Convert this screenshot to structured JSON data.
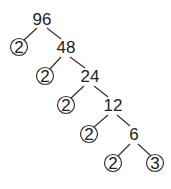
{
  "diagram": {
    "type": "factor-tree",
    "root": "96",
    "nodes": [
      {
        "id": "n96",
        "label": "96",
        "x": 42,
        "y": 19,
        "prime": false
      },
      {
        "id": "p1",
        "label": "2",
        "x": 19,
        "y": 47,
        "prime": true
      },
      {
        "id": "n48",
        "label": "48",
        "x": 66,
        "y": 47,
        "prime": false
      },
      {
        "id": "p2",
        "label": "2",
        "x": 45,
        "y": 76,
        "prime": true
      },
      {
        "id": "n24",
        "label": "24",
        "x": 90,
        "y": 76,
        "prime": false
      },
      {
        "id": "p3",
        "label": "2",
        "x": 66,
        "y": 105,
        "prime": true
      },
      {
        "id": "n12",
        "label": "12",
        "x": 113,
        "y": 105,
        "prime": false
      },
      {
        "id": "p4",
        "label": "2",
        "x": 89,
        "y": 134,
        "prime": true
      },
      {
        "id": "n6",
        "label": "6",
        "x": 134,
        "y": 134,
        "prime": false
      },
      {
        "id": "p5",
        "label": "2",
        "x": 113,
        "y": 163,
        "prime": true
      },
      {
        "id": "p6",
        "label": "3",
        "x": 155,
        "y": 163,
        "prime": true
      }
    ],
    "edges": [
      [
        "n96",
        "p1"
      ],
      [
        "n96",
        "n48"
      ],
      [
        "n48",
        "p2"
      ],
      [
        "n48",
        "n24"
      ],
      [
        "n24",
        "p3"
      ],
      [
        "n24",
        "n12"
      ],
      [
        "n12",
        "p4"
      ],
      [
        "n12",
        "n6"
      ],
      [
        "n6",
        "p5"
      ],
      [
        "n6",
        "p6"
      ]
    ]
  }
}
